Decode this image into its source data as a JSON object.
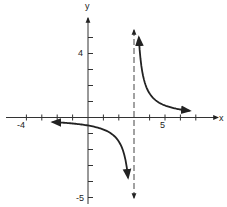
{
  "chart_data": {
    "type": "line",
    "title": "",
    "function": "y = 1.5/(x - 3)",
    "xlabel": "x",
    "ylabel": "y",
    "xlim": [
      -5.5,
      7.5
    ],
    "ylim": [
      -5.5,
      7
    ],
    "grid": false,
    "x_tick_labels": [
      {
        "value": -4,
        "label": "-4"
      },
      {
        "value": 5,
        "label": "5"
      }
    ],
    "y_tick_labels": [
      {
        "value": 4,
        "label": "4"
      },
      {
        "value": -5,
        "label": "-5"
      }
    ],
    "x_ticks": [
      -4,
      -3,
      -2,
      -1,
      1,
      2,
      4,
      5,
      6,
      7
    ],
    "y_ticks": [
      -5,
      -4,
      -3,
      -2,
      -1,
      1,
      2,
      3,
      4,
      5
    ],
    "asymptotes": [
      {
        "type": "vertical",
        "x": 3,
        "style": "dashed"
      },
      {
        "type": "horizontal",
        "y": 0
      }
    ],
    "series": [
      {
        "name": "left branch",
        "x_range": [
          -2.3,
          2.6
        ],
        "points": [
          [
            -2.3,
            -0.28
          ],
          [
            -1,
            -0.375
          ],
          [
            0,
            -0.5
          ],
          [
            1,
            -0.75
          ],
          [
            2,
            -1.5
          ],
          [
            2.4,
            -2.5
          ],
          [
            2.6,
            -3.75
          ]
        ]
      },
      {
        "name": "right branch",
        "x_range": [
          3.3,
          6.6
        ],
        "points": [
          [
            3.33,
            4.5
          ],
          [
            3.5,
            3
          ],
          [
            4,
            1.5
          ],
          [
            5,
            0.75
          ],
          [
            6,
            0.5
          ],
          [
            6.6,
            0.42
          ]
        ]
      }
    ]
  },
  "labels": {
    "x_axis": "x",
    "y_axis": "y",
    "x_neg4": "-4",
    "x_pos5": "5",
    "y_pos4": "4",
    "y_neg5": "-5"
  }
}
